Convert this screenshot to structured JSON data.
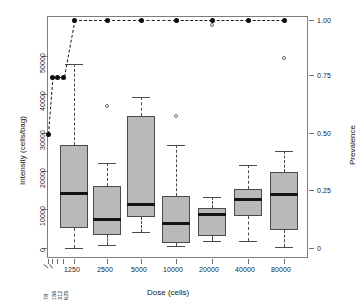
{
  "chart_data": {
    "type": "box",
    "title": "",
    "xlabel": "Dose (cells)",
    "ylabel": "Intensity (cells/bag)",
    "y2label": "Prevalence",
    "grid": false,
    "legend": "none",
    "ylim": [
      0,
      62500
    ],
    "y2lim": [
      0,
      1.0
    ],
    "ytick_labels": [
      "0",
      "10000",
      "20000",
      "30000",
      "40000",
      "50000"
    ],
    "ytick_values": [
      0,
      10000,
      20000,
      30000,
      40000,
      50000
    ],
    "y2tick_labels": [
      "0",
      "0.25",
      "0.50",
      "0.75",
      "1.00"
    ],
    "y2tick_values": [
      0,
      0.25,
      0.5,
      0.75,
      1.0
    ],
    "categories": [
      "78",
      "156",
      "312",
      "625",
      "1250",
      "2500",
      "5000",
      "10000",
      "20000",
      "40000",
      "80000"
    ],
    "small_categories": [
      "78",
      "156",
      "312",
      "625"
    ],
    "main_categories": [
      "1250",
      "2500",
      "5000",
      "10000",
      "20000",
      "40000",
      "80000"
    ],
    "boxes": [
      {
        "dose": "1250",
        "lower_whisker": 0,
        "q1": 5100,
        "median": 14200,
        "q3": 26800,
        "upper_whisker": 47800,
        "outliers": []
      },
      {
        "dose": "2500",
        "lower_whisker": 800,
        "q1": 3500,
        "median": 7400,
        "q3": 16200,
        "upper_whisker": 22200,
        "outliers": [
          37000
        ]
      },
      {
        "dose": "5000",
        "lower_whisker": 4200,
        "q1": 8200,
        "median": 11300,
        "q3": 34500,
        "upper_whisker": 39200,
        "outliers": []
      },
      {
        "dose": "10000",
        "lower_whisker": 500,
        "q1": 1300,
        "median": 6400,
        "q3": 13500,
        "upper_whisker": 26900,
        "outliers": [
          34500
        ]
      },
      {
        "dose": "20000",
        "lower_whisker": 1900,
        "q1": 3200,
        "median": 8700,
        "q3": 10300,
        "upper_whisker": 13200,
        "outliers": [
          58000
        ]
      },
      {
        "dose": "40000",
        "lower_whisker": 1900,
        "q1": 8400,
        "median": 12600,
        "q3": 15300,
        "upper_whisker": 21700,
        "outliers": []
      },
      {
        "dose": "80000",
        "lower_whisker": 300,
        "q1": 4600,
        "median": 13900,
        "q3": 19700,
        "upper_whisker": 25300,
        "outliers": [
          49500
        ]
      }
    ],
    "prevalence_series": {
      "name": "Prevalence",
      "x": [
        "78",
        "156",
        "312",
        "625",
        "1250",
        "2500",
        "5000",
        "10000",
        "20000",
        "40000",
        "80000"
      ],
      "values": [
        0.5,
        0.75,
        0.75,
        0.75,
        1.0,
        1.0,
        1.0,
        1.0,
        1.0,
        1.0,
        1.0
      ],
      "marker": "filled-circle",
      "line": "dashed"
    }
  }
}
